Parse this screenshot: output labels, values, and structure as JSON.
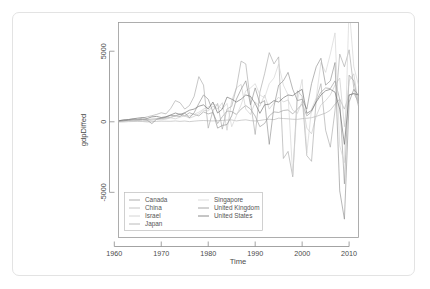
{
  "window": {
    "title": "R Plot Device"
  },
  "axes": {
    "x_title": "Time",
    "y_title": "gdpDiffed",
    "x_ticks": [
      "1960",
      "1970",
      "1980",
      "1990",
      "2000",
      "2010"
    ],
    "x_tick_values": [
      1960,
      1970,
      1980,
      1990,
      2000,
      2010
    ],
    "y_ticks": [
      "5000",
      "0",
      "-5000"
    ],
    "y_tick_values": [
      5000,
      0,
      -5000
    ]
  },
  "legend": {
    "entries": [
      {
        "label": "Canada",
        "color": "#9a9a9a"
      },
      {
        "label": "China",
        "color": "#b5b5b5"
      },
      {
        "label": "Israel",
        "color": "#c9c9c9"
      },
      {
        "label": "Japan",
        "color": "#a8a8a8"
      },
      {
        "label": "Singapore",
        "color": "#d2d2d2"
      },
      {
        "label": "United Kingdom",
        "color": "#8f8f8f"
      },
      {
        "label": "United States",
        "color": "#6f6f6f"
      }
    ]
  },
  "chart_data": {
    "type": "line",
    "title": "",
    "subtitle": "",
    "xlabel": "Time",
    "ylabel": "gdpDiffed",
    "xlim": [
      1961,
      2012
    ],
    "ylim": [
      -8200,
      7000
    ],
    "grid": false,
    "legend_position": "bottom-left-inside",
    "x": [
      1961,
      1962,
      1963,
      1964,
      1965,
      1966,
      1967,
      1968,
      1969,
      1970,
      1971,
      1972,
      1973,
      1974,
      1975,
      1976,
      1977,
      1978,
      1979,
      1980,
      1981,
      1982,
      1983,
      1984,
      1985,
      1986,
      1987,
      1988,
      1989,
      1990,
      1991,
      1992,
      1993,
      1994,
      1995,
      1996,
      1997,
      1998,
      1999,
      2000,
      2001,
      2002,
      2003,
      2004,
      2005,
      2006,
      2007,
      2008,
      2009,
      2010,
      2011,
      2012
    ],
    "series": [
      {
        "name": "Canada",
        "color": "#9a9a9a",
        "values": [
          60,
          80,
          95,
          130,
          150,
          175,
          150,
          190,
          210,
          230,
          260,
          320,
          420,
          560,
          420,
          640,
          520,
          420,
          700,
          560,
          660,
          -120,
          360,
          760,
          720,
          520,
          900,
          1150,
          900,
          400,
          -350,
          -120,
          420,
          700,
          660,
          800,
          840,
          560,
          900,
          1250,
          420,
          700,
          1500,
          2100,
          2400,
          2350,
          2900,
          1600,
          -4400,
          3300,
          2900,
          1300
        ]
      },
      {
        "name": "China",
        "color": "#b5b5b5",
        "values": [
          -15,
          -10,
          10,
          20,
          25,
          20,
          -10,
          5,
          30,
          45,
          40,
          35,
          60,
          30,
          55,
          10,
          45,
          75,
          90,
          70,
          60,
          80,
          95,
          120,
          130,
          60,
          110,
          140,
          80,
          60,
          95,
          150,
          180,
          150,
          260,
          230,
          210,
          180,
          170,
          220,
          250,
          290,
          380,
          500,
          620,
          820,
          1250,
          1600,
          900,
          1900,
          2000,
          1400
        ]
      },
      {
        "name": "Israel",
        "color": "#c9c9c9",
        "values": [
          30,
          55,
          80,
          70,
          110,
          60,
          30,
          120,
          160,
          140,
          190,
          280,
          210,
          330,
          420,
          260,
          380,
          560,
          820,
          760,
          1100,
          920,
          1350,
          -600,
          1500,
          2400,
          2650,
          900,
          520,
          1400,
          1100,
          1900,
          900,
          1350,
          1750,
          1400,
          1550,
          820,
          600,
          1450,
          -450,
          -850,
          420,
          1200,
          1500,
          1900,
          2600,
          3100,
          -350,
          2900,
          3400,
          1200
        ]
      },
      {
        "name": "Japan",
        "color": "#a8a8a8",
        "values": [
          80,
          140,
          150,
          200,
          180,
          260,
          350,
          430,
          520,
          640,
          560,
          940,
          1500,
          1350,
          900,
          1150,
          1800,
          3200,
          2600,
          -450,
          780,
          1300,
          -520,
          900,
          1100,
          2400,
          4300,
          4100,
          1400,
          -900,
          2100,
          3400,
          4900,
          4100,
          4600,
          -2600,
          -2100,
          -3900,
          2200,
          1800,
          -2400,
          -2800,
          1600,
          2700,
          -600,
          -1800,
          800,
          4800,
          3900,
          5100,
          2400,
          1100
        ]
      },
      {
        "name": "Singapore",
        "color": "#d2d2d2",
        "values": [
          25,
          40,
          60,
          55,
          80,
          95,
          110,
          130,
          170,
          210,
          240,
          300,
          420,
          520,
          380,
          430,
          540,
          680,
          900,
          1050,
          1250,
          1150,
          900,
          1300,
          -350,
          420,
          1200,
          2200,
          2400,
          2700,
          1900,
          1700,
          2700,
          3100,
          4100,
          2600,
          1900,
          -3800,
          1500,
          3000,
          -2200,
          900,
          1700,
          4200,
          3500,
          4800,
          6300,
          -1700,
          -2900,
          8200,
          3900,
          2600
        ]
      },
      {
        "name": "United Kingdom",
        "color": "#8f8f8f",
        "values": [
          45,
          70,
          110,
          140,
          130,
          160,
          120,
          -130,
          180,
          260,
          320,
          460,
          420,
          380,
          620,
          280,
          640,
          1300,
          1900,
          1600,
          700,
          -450,
          -260,
          -200,
          420,
          1600,
          2300,
          2900,
          1200,
          2400,
          1300,
          1500,
          -1600,
          1100,
          2600,
          2900,
          3500,
          2300,
          1500,
          1600,
          900,
          2700,
          3900,
          4500,
          2600,
          2900,
          4200,
          -4900,
          -6900,
          1400,
          2300,
          1900
        ]
      },
      {
        "name": "United States",
        "color": "#6f6f6f",
        "values": [
          70,
          130,
          160,
          210,
          260,
          300,
          230,
          350,
          380,
          300,
          360,
          480,
          620,
          520,
          640,
          820,
          900,
          1100,
          1200,
          900,
          1400,
          620,
          900,
          1750,
          1600,
          1400,
          1600,
          1900,
          1800,
          1300,
          600,
          1200,
          1250,
          1500,
          1400,
          1700,
          1900,
          1850,
          2100,
          2300,
          600,
          800,
          1400,
          1900,
          2200,
          2300,
          2100,
          900,
          -1600,
          1900,
          2000,
          1900
        ]
      }
    ]
  }
}
